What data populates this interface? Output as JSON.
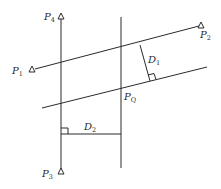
{
  "diagram": {
    "type": "geometry",
    "colors": {
      "stroke": "#2a2a2a",
      "background": "#ffffff"
    },
    "points": {
      "P1": {
        "label": "P",
        "sub": "1",
        "x": 32,
        "y": 70
      },
      "P2": {
        "label": "P",
        "sub": "2",
        "x": 201,
        "y": 25
      },
      "P3": {
        "label": "P",
        "sub": "3",
        "x": 61,
        "y": 174
      },
      "P4": {
        "label": "P",
        "sub": "4",
        "x": 61,
        "y": 16
      },
      "PQ": {
        "label": "P",
        "sub": "Q"
      }
    },
    "distances": {
      "D1": {
        "label": "D",
        "sub": "1"
      },
      "D2": {
        "label": "D",
        "sub": "2"
      }
    }
  }
}
